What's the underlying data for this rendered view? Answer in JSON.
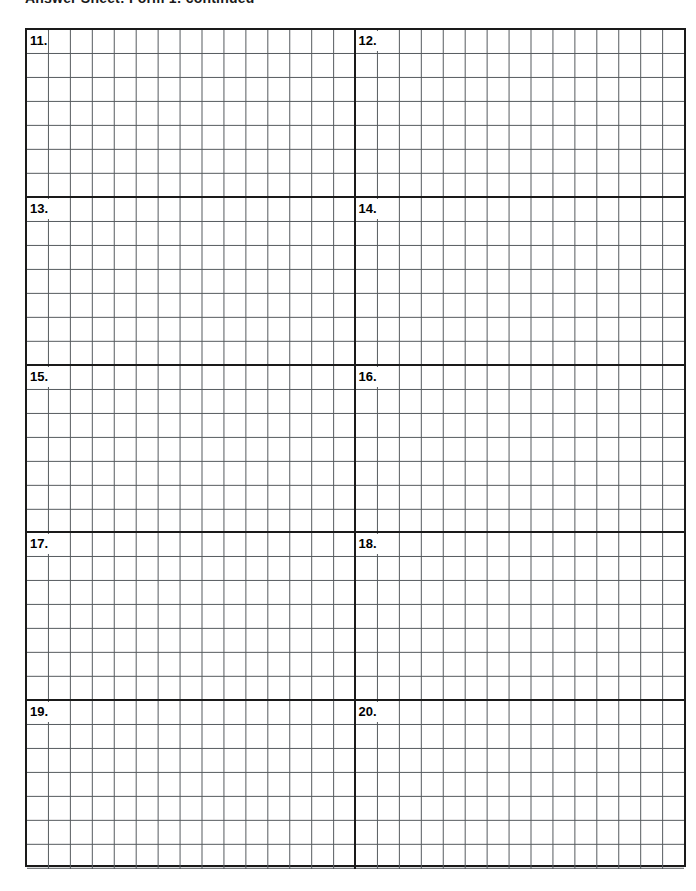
{
  "page": {
    "title": "Answer Sheet: Form 1: continued",
    "title_clipped": true,
    "background_color": "#ffffff",
    "ink_color": "#1a1a1a",
    "rule_color": "#555a5e"
  },
  "answer_grid": {
    "name": "answer-grid",
    "columns_per_half": 15,
    "rows_per_block": 7,
    "blocks": [
      {
        "left": {
          "number": "11."
        },
        "right": {
          "number": "12."
        }
      },
      {
        "left": {
          "number": "13."
        },
        "right": {
          "number": "14."
        }
      },
      {
        "left": {
          "number": "15."
        },
        "right": {
          "number": "16."
        }
      },
      {
        "left": {
          "number": "17."
        },
        "right": {
          "number": "18."
        }
      },
      {
        "left": {
          "number": "19."
        },
        "right": {
          "number": "20."
        }
      }
    ]
  }
}
